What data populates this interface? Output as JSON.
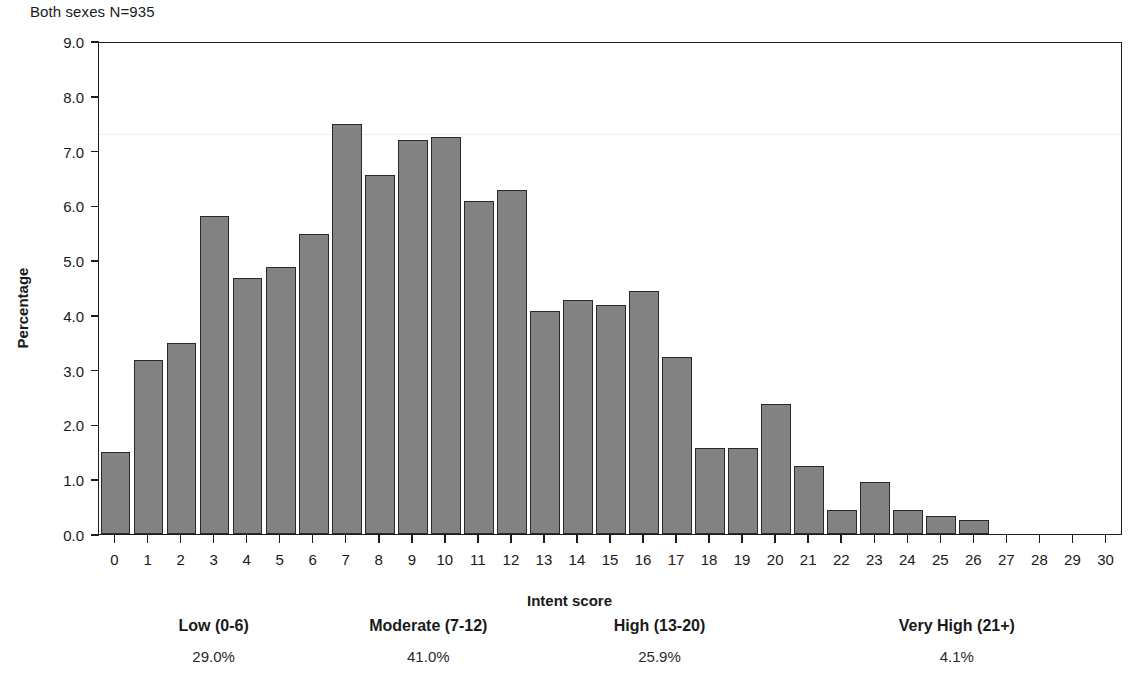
{
  "chart_data": {
    "type": "bar",
    "title": "Both sexes N=935",
    "xlabel": "Intent score",
    "ylabel": "Percentage",
    "xlim": [
      -0.5,
      30.5
    ],
    "ylim": [
      0.0,
      9.0
    ],
    "grid": false,
    "legend": "none",
    "bar_color": "#828282",
    "bar_edge_color": "#2a2a2a",
    "y_ticks": [
      "0.0",
      "1.0",
      "2.0",
      "3.0",
      "4.0",
      "5.0",
      "6.0",
      "7.0",
      "8.0",
      "9.0"
    ],
    "y_tick_values": [
      0,
      1,
      2,
      3,
      4,
      5,
      6,
      7,
      8,
      9
    ],
    "categories": [
      "0",
      "1",
      "2",
      "3",
      "4",
      "5",
      "6",
      "7",
      "8",
      "9",
      "10",
      "11",
      "12",
      "13",
      "14",
      "15",
      "16",
      "17",
      "18",
      "19",
      "20",
      "21",
      "22",
      "23",
      "24",
      "25",
      "26",
      "27",
      "28",
      "29",
      "30"
    ],
    "values": [
      1.5,
      3.18,
      3.49,
      5.8,
      4.68,
      4.88,
      5.47,
      7.48,
      6.56,
      7.19,
      7.25,
      6.08,
      6.28,
      4.08,
      4.27,
      4.18,
      4.43,
      3.24,
      1.57,
      1.57,
      2.37,
      1.24,
      0.44,
      0.95,
      0.43,
      0.33,
      0.25,
      0.0,
      0.0,
      0.0,
      0.0
    ],
    "groups": [
      {
        "label": "Low (0-6)",
        "percent": "29.0%",
        "range_start": 0,
        "range_end": 6
      },
      {
        "label": "Moderate (7-12)",
        "percent": "41.0%",
        "range_start": 7,
        "range_end": 12
      },
      {
        "label": "High (13-20)",
        "percent": "25.9%",
        "range_start": 13,
        "range_end": 20
      },
      {
        "label": "Very High (21+)",
        "percent": "4.1%",
        "range_start": 21,
        "range_end": 30
      }
    ]
  }
}
